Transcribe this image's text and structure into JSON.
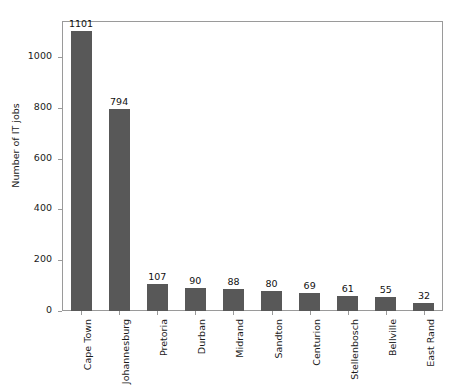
{
  "chart_data": {
    "type": "bar",
    "title": "",
    "subtitle": "",
    "xlabel": "",
    "ylabel": "Number of IT jobs",
    "categories": [
      "Cape Town",
      "Johannesburg",
      "Pretoria",
      "Durban",
      "Midrand",
      "Sandton",
      "Centurion",
      "Stellenbosch",
      "Bellville",
      "East Rand"
    ],
    "values": [
      1101,
      794,
      107,
      90,
      88,
      80,
      69,
      61,
      55,
      32
    ],
    "data_labels": [
      "1101",
      "794",
      "107",
      "90",
      "88",
      "80",
      "69",
      "61",
      "55",
      "32"
    ],
    "ylim": [
      0,
      1142
    ],
    "yticks": [
      0,
      200,
      400,
      600,
      800,
      1000
    ],
    "ytick_labels": [
      "0",
      "200",
      "400",
      "600",
      "800",
      "1000"
    ],
    "grid": false,
    "legend": null,
    "bar_color": "#585858",
    "axis_color": "#9a9a9a",
    "text_color": "#1a1a1a",
    "background": "#ffffff",
    "xtick_rotation": 90
  }
}
